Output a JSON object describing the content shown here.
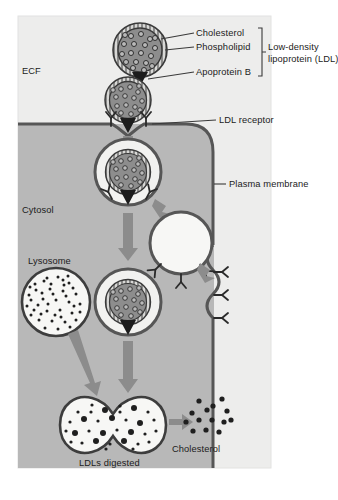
{
  "figure": {
    "title_visible": false,
    "topic": "receptor-mediated endocytosis of low-density lipoprotein",
    "background_color": "#ffffff",
    "panel_color": "#ececeb",
    "cytosol_color": "#b4b4b4",
    "membrane_color": "#595959",
    "ldl_fill_color": "#8e8e8e",
    "arrow_color": "#8a8a8a",
    "text_color": "#1b1b1b"
  },
  "regions": {
    "ecf_label": "ECF",
    "cytosol_label": "Cytosol"
  },
  "callouts": {
    "cholesterol": "Cholesterol",
    "phospholipid": "Phospholipid",
    "apoprotein_b": "Apoprotein B",
    "ldl_bracket_line1": "Low-density",
    "ldl_bracket_line2": "lipoprotein (LDL)",
    "ldl_receptor": "LDL receptor",
    "plasma_membrane": "Plasma membrane"
  },
  "organelles": {
    "lysosome": "Lysosome",
    "ldls_digested": "LDLs digested",
    "cholesterol_released": "Cholesterol"
  },
  "structures": {
    "ldl_particle_free": {
      "name": "free-ldl-particle",
      "cx": 140,
      "cy": 50,
      "r": 27,
      "cholesterol_dots": 19
    },
    "ldl_particle_bound": {
      "name": "membrane-bound-ldl-particle",
      "cx": 128,
      "cy": 100,
      "r": 22,
      "cholesterol_dots": 15
    },
    "coated_vesicle": {
      "name": "endocytic-vesicle",
      "cx": 128,
      "cy": 172,
      "outer_r": 33,
      "inner_r": 22
    },
    "empty_vesicle": {
      "name": "recycling-vesicle",
      "cx": 181,
      "cy": 243,
      "r": 31
    },
    "lysosome_body": {
      "name": "lysosome",
      "cx": 56,
      "cy": 302,
      "r": 34,
      "enzyme_dots": 44
    },
    "endosome": {
      "name": "ldl-containing-endosome",
      "cx": 128,
      "cy": 302,
      "outer_r": 33,
      "inner_r": 22
    },
    "digestion_vacuole": {
      "name": "digestion-vacuole",
      "cx": 105,
      "cy": 425,
      "label": "LDLs digested"
    },
    "released_cholesterol": {
      "name": "released-cholesterol-cloud",
      "cx": 200,
      "cy": 418,
      "dots": 14
    }
  },
  "receptors": {
    "glyph": "Y-shaped",
    "on_flat_membrane": 2,
    "on_vesicle": 2,
    "on_recycling_vesicle": 3,
    "reinserting_into_membrane": 3
  },
  "arrows": {
    "into_cell": "downward",
    "to_endosome": "downward",
    "lysosome_to_vacuole": "diagonal-down-right",
    "endosome_to_vacuole": "downward",
    "vesicle_to_membrane": "diagonal-down-right",
    "release_cholesterol": "rightward"
  }
}
